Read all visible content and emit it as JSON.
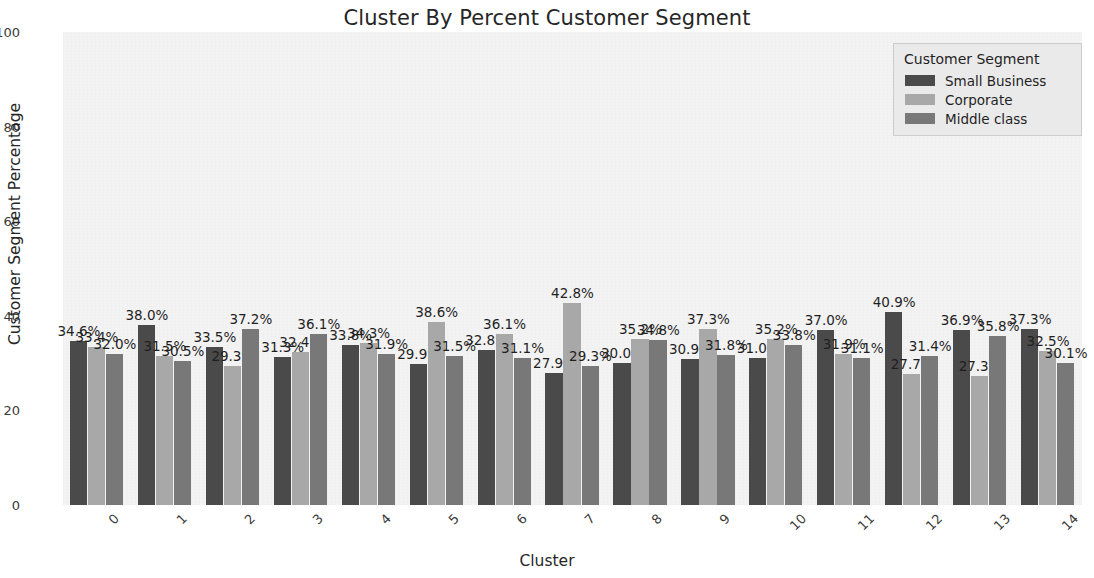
{
  "chart_data": {
    "type": "bar",
    "title": "Cluster By Percent Customer Segment",
    "xlabel": "Cluster",
    "ylabel": "Customer Segment Percentage",
    "ylim": [
      0,
      100
    ],
    "yticks": [
      0,
      20,
      40,
      60,
      80,
      100
    ],
    "ytick_labels": [
      "0",
      "20",
      "40",
      "60",
      "80",
      "100"
    ],
    "grid": false,
    "legend_position": "upper right",
    "legend_title": "Customer Segment",
    "categories": [
      "0",
      "1",
      "2",
      "3",
      "4",
      "5",
      "6",
      "7",
      "8",
      "9",
      "10",
      "11",
      "12",
      "13",
      "14"
    ],
    "series": [
      {
        "name": "Small Business",
        "color": "#4a4a4a",
        "values": [
          34.6,
          38.0,
          33.5,
          31.3,
          33.8,
          29.9,
          32.8,
          27.9,
          30.0,
          30.9,
          31.0,
          37.0,
          40.9,
          36.9,
          37.3
        ],
        "labels": [
          "34.6%",
          "38.0%",
          "33.5%",
          "31.3%",
          "33.8%",
          "29.9%",
          "32.8%",
          "27.9%",
          "30.0%",
          "30.9%",
          "31.0%",
          "37.0%",
          "40.9%",
          "36.9%",
          "37.3%"
        ]
      },
      {
        "name": "Corporate",
        "color": "#a8a8a8",
        "values": [
          33.4,
          31.5,
          29.3,
          32.4,
          34.3,
          38.6,
          36.1,
          42.8,
          35.2,
          37.3,
          35.2,
          31.9,
          27.7,
          27.3,
          32.5
        ],
        "labels": [
          "33.4%",
          "31.5%",
          "29.3%",
          "32.4%",
          "34.3%",
          "38.6%",
          "36.1%",
          "42.8%",
          "35.2%",
          "37.3%",
          "35.2%",
          "31.9%",
          "27.7%",
          "27.3%",
          "32.5%"
        ]
      },
      {
        "name": "Middle class",
        "color": "#787878",
        "values": [
          32.0,
          30.5,
          37.2,
          36.1,
          31.9,
          31.5,
          31.1,
          29.3,
          34.8,
          31.8,
          33.8,
          31.1,
          31.4,
          35.8,
          30.1
        ],
        "labels": [
          "32.0%",
          "30.5%",
          "37.2%",
          "36.1%",
          "31.9%",
          "31.5%",
          "31.1%",
          "29.3%",
          "34.8%",
          "31.8%",
          "33.8%",
          "31.1%",
          "31.4%",
          "35.8%",
          "30.1%"
        ]
      }
    ]
  }
}
